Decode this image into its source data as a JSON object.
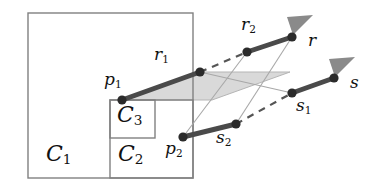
{
  "figure": {
    "background_color": "#ffffff",
    "width": 380,
    "height": 194,
    "colors": {
      "rectangle_stroke": "#808080",
      "segment_stroke": "#4a4a4a",
      "dot_fill": "#2b2b2b",
      "band_fill": "#d9d9d9",
      "band_stroke": "#b5b5b5",
      "thin_guide": "#a8a8a8",
      "dashed": "#555555",
      "arrow_fill": "#8a8a8a",
      "label_color": "#111111"
    },
    "regions": [
      {
        "name": "C1",
        "label": "C",
        "subscript": "1",
        "x": 28,
        "y": 13,
        "width": 165,
        "height": 165,
        "label_x": 46,
        "label_y": 143
      },
      {
        "name": "C2",
        "label": "C",
        "subscript": "2",
        "x": 110,
        "y": 100,
        "width": 83,
        "height": 78,
        "label_x": 118,
        "label_y": 143
      },
      {
        "name": "C3",
        "label": "C",
        "subscript": "3",
        "x": 110,
        "y": 100,
        "width": 45,
        "height": 38,
        "label_x": 117,
        "label_y": 104
      }
    ],
    "band": {
      "name": "translation-band",
      "points": "122,100 200,72 290,72 212,100"
    },
    "segments": [
      {
        "name": "segment-p1-r1",
        "x1": 122,
        "y1": 100,
        "x2": 200,
        "y2": 72,
        "start_point": "p1",
        "end_point": "r1"
      },
      {
        "name": "segment-p2-s2",
        "x1": 183,
        "y1": 137,
        "x2": 236,
        "y2": 124,
        "start_point": "p2",
        "end_point": "s2"
      },
      {
        "name": "segment-r2-r",
        "x1": 247,
        "y1": 52,
        "x2": 292,
        "y2": 37,
        "start_point": "r2",
        "end_point": "r"
      },
      {
        "name": "segment-s1-s",
        "x1": 292,
        "y1": 93,
        "x2": 334,
        "y2": 78,
        "start_point": "s1",
        "end_point": "s"
      }
    ],
    "dashed_links": [
      {
        "name": "dash-r1-r2",
        "x1": 200,
        "y1": 72,
        "x2": 247,
        "y2": 52
      },
      {
        "name": "dash-s2-s1",
        "x1": 236,
        "y1": 124,
        "x2": 292,
        "y2": 93
      }
    ],
    "guides": [
      {
        "name": "guide-p2-r2",
        "x1": 183,
        "y1": 137,
        "x2": 247,
        "y2": 52
      },
      {
        "name": "guide-s2-r",
        "x1": 236,
        "y1": 124,
        "x2": 292,
        "y2": 37
      },
      {
        "name": "guide-r1-s1",
        "x1": 200,
        "y1": 72,
        "x2": 292,
        "y2": 93
      }
    ],
    "dots": [
      {
        "name": "dot-p1",
        "cx": 122,
        "cy": 100
      },
      {
        "name": "dot-r1",
        "cx": 200,
        "cy": 72
      },
      {
        "name": "dot-p2",
        "cx": 183,
        "cy": 137
      },
      {
        "name": "dot-s2",
        "cx": 236,
        "cy": 124
      },
      {
        "name": "dot-r2",
        "cx": 247,
        "cy": 52
      },
      {
        "name": "dot-r-end",
        "cx": 292,
        "cy": 37
      },
      {
        "name": "dot-s1",
        "cx": 292,
        "cy": 93
      },
      {
        "name": "dot-s-end",
        "cx": 334,
        "cy": 78
      }
    ],
    "arrows": [
      {
        "name": "arrow-r",
        "tip_x": 313,
        "tip_y": 15,
        "angle": -20
      },
      {
        "name": "arrow-s",
        "tip_x": 355,
        "tip_y": 57,
        "angle": -20
      }
    ],
    "point_labels": [
      {
        "name": "label-p1",
        "base": "p",
        "sub": "1",
        "x": 104,
        "y": 71,
        "size": "mid"
      },
      {
        "name": "label-r1",
        "base": "r",
        "sub": "1",
        "x": 154,
        "y": 46,
        "size": "mid"
      },
      {
        "name": "label-p2",
        "base": "p",
        "sub": "2",
        "x": 165,
        "y": 140,
        "size": "mid"
      },
      {
        "name": "label-s2",
        "base": "s",
        "sub": "2",
        "x": 216,
        "y": 129,
        "size": "mid"
      },
      {
        "name": "label-r2",
        "base": "r",
        "sub": "2",
        "x": 241,
        "y": 16,
        "size": "mid"
      },
      {
        "name": "label-r",
        "base": "r",
        "sub": "",
        "x": 308,
        "y": 32,
        "size": "mid"
      },
      {
        "name": "label-s1",
        "base": "s",
        "sub": "1",
        "x": 296,
        "y": 97,
        "size": "mid"
      },
      {
        "name": "label-s",
        "base": "s",
        "sub": "",
        "x": 350,
        "y": 74,
        "size": "mid"
      }
    ]
  }
}
